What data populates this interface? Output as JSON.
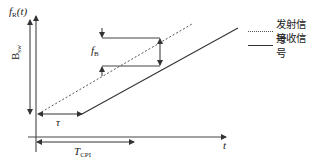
{
  "diagram": {
    "title": "",
    "y_axis_label": {
      "main": "f",
      "sub": "R",
      "suffix": "(t)"
    },
    "bandwidth_label": {
      "main": "B",
      "sub": "sw"
    },
    "beat_label": {
      "main": "f",
      "sub": "B"
    },
    "delay_label": "τ",
    "cpi_label": {
      "main": "T",
      "sub": "CPI"
    },
    "x_axis_label": "t",
    "colors": {
      "line": "#333333",
      "dashed": "#555555",
      "background": "#ffffff"
    }
  },
  "legend": {
    "items": [
      {
        "style": "dotted",
        "label": "发射信号"
      },
      {
        "style": "solid",
        "label": "接收信号"
      }
    ]
  }
}
